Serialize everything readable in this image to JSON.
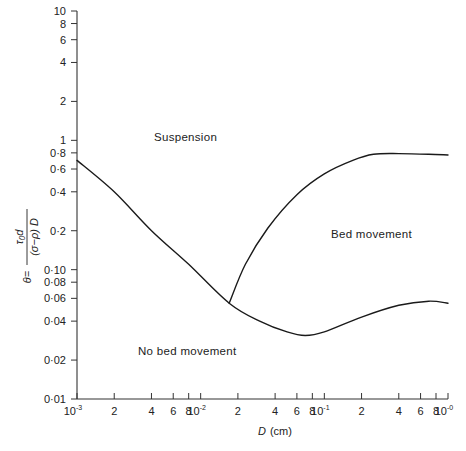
{
  "chart_data": {
    "type": "line",
    "title": "",
    "xlabel": "D (cm)",
    "ylabel": "θ = τ₀d / ((σ−ρ) D)",
    "xscale": "log",
    "yscale": "log",
    "xlim": [
      0.001,
      1.0
    ],
    "ylim": [
      0.01,
      10
    ],
    "grid": false,
    "x_ticks": [
      {
        "value": 0.001,
        "label": "10",
        "sup": "-3"
      },
      {
        "value": 0.002,
        "label": "2"
      },
      {
        "value": 0.004,
        "label": "4"
      },
      {
        "value": 0.006,
        "label": "6"
      },
      {
        "value": 0.008,
        "label": "8"
      },
      {
        "value": 0.01,
        "label": "10",
        "sup": "-2"
      },
      {
        "value": 0.02,
        "label": "2"
      },
      {
        "value": 0.04,
        "label": "4"
      },
      {
        "value": 0.06,
        "label": "6"
      },
      {
        "value": 0.08,
        "label": "8"
      },
      {
        "value": 0.1,
        "label": "10",
        "sup": "-1"
      },
      {
        "value": 0.2,
        "label": "2"
      },
      {
        "value": 0.4,
        "label": "4"
      },
      {
        "value": 0.6,
        "label": "6"
      },
      {
        "value": 0.8,
        "label": "8"
      },
      {
        "value": 1.0,
        "label": "10",
        "sup": "-0"
      }
    ],
    "y_ticks": [
      {
        "value": 10,
        "label": "10"
      },
      {
        "value": 8,
        "label": "8"
      },
      {
        "value": 6,
        "label": "6"
      },
      {
        "value": 4,
        "label": "4"
      },
      {
        "value": 2,
        "label": "2"
      },
      {
        "value": 1,
        "label": "1"
      },
      {
        "value": 0.8,
        "label": "0·8"
      },
      {
        "value": 0.6,
        "label": "0·6"
      },
      {
        "value": 0.4,
        "label": "0·4"
      },
      {
        "value": 0.2,
        "label": "0·2"
      },
      {
        "value": 0.1,
        "label": "0·10"
      },
      {
        "value": 0.08,
        "label": "0·08"
      },
      {
        "value": 0.06,
        "label": "0·06"
      },
      {
        "value": 0.04,
        "label": "0·04"
      },
      {
        "value": 0.02,
        "label": "0·02"
      },
      {
        "value": 0.01,
        "label": "0·01"
      }
    ],
    "series": [
      {
        "name": "Threshold of bed movement (lower curve)",
        "x": [
          0.001,
          0.002,
          0.004,
          0.008,
          0.017,
          0.03,
          0.05,
          0.07,
          0.1,
          0.2,
          0.4,
          0.7,
          1.0
        ],
        "y": [
          0.7,
          0.4,
          0.2,
          0.11,
          0.055,
          0.04,
          0.033,
          0.031,
          0.033,
          0.043,
          0.053,
          0.057,
          0.055
        ]
      },
      {
        "name": "Threshold of suspension (upper curve)",
        "x": [
          0.017,
          0.023,
          0.035,
          0.06,
          0.1,
          0.17,
          0.25,
          0.4,
          0.7,
          1.0
        ],
        "y": [
          0.055,
          0.11,
          0.21,
          0.38,
          0.55,
          0.7,
          0.78,
          0.79,
          0.78,
          0.77
        ]
      }
    ],
    "annotations": [
      {
        "text": "Suspension",
        "x": 0.005,
        "y": 0.9
      },
      {
        "text": "Bed movement",
        "x": 0.25,
        "y": 0.2
      },
      {
        "text": "No bed movement",
        "x": 0.0045,
        "y": 0.025
      }
    ]
  },
  "labels": {
    "suspension": "Suspension",
    "bed_movement": "Bed movement",
    "no_bed_movement": "No bed movement",
    "xlabel_var": "D",
    "xlabel_unit": "(cm)",
    "ylabel_theta": "θ=",
    "ylabel_num": "τ₀d",
    "ylabel_den": "(σ−ρ) D"
  }
}
